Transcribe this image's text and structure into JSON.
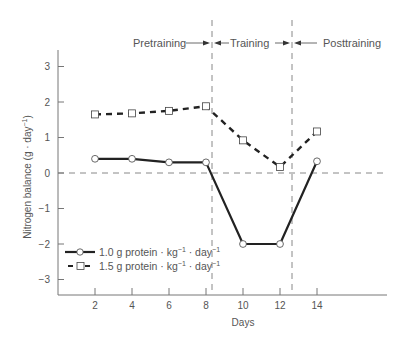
{
  "chart_data": {
    "type": "line",
    "title": "",
    "xlabel": "Days",
    "ylabel": "Nitrogen balance (g · day⁻¹)",
    "x": [
      2,
      4,
      6,
      8,
      10,
      12,
      14
    ],
    "x_ticks": [
      "2",
      "4",
      "6",
      "8",
      "10",
      "12",
      "14"
    ],
    "y_ticks": [
      "3",
      "2",
      "1",
      "0",
      "−1",
      "−2",
      "−3"
    ],
    "y_tick_values": [
      3,
      2,
      1,
      0,
      -1,
      -2,
      -3
    ],
    "xlim": [
      0,
      17.5
    ],
    "ylim": [
      -3.5,
      3.6
    ],
    "grid": false,
    "reference_lines": {
      "horizontal_zero": 0,
      "phase_boundaries_days": [
        8.3,
        12.6
      ]
    },
    "phases": [
      {
        "label": "Pretraining",
        "arrow": "right"
      },
      {
        "label": "Training",
        "arrow": "both"
      },
      {
        "label": "Posttraining",
        "arrow": "left"
      }
    ],
    "series": [
      {
        "name": "1.0 g protein · kg⁻¹ · day⁻¹",
        "marker": "circle",
        "line": "solid",
        "values": [
          0.4,
          0.4,
          0.3,
          0.3,
          -2.0,
          -2.0,
          0.33
        ]
      },
      {
        "name": "1.5 g protein · kg⁻¹ · day⁻¹",
        "marker": "square",
        "line": "dashed",
        "values": [
          1.65,
          1.68,
          1.75,
          1.88,
          0.92,
          0.17,
          1.17
        ]
      }
    ],
    "legend_position": "lower-left inside plot"
  },
  "labels": {
    "xlabel": "Days",
    "ylabel_main": "Nitrogen balance (g · day",
    "ylabel_sup": "−1",
    "ylabel_close": ")",
    "phase_pre": "Pretraining",
    "phase_train": "Training",
    "phase_post": "Posttraining",
    "legend": [
      {
        "main": "1.0 g protein · kg",
        "sup1": "−1",
        "mid": " · day",
        "sup2": "−1"
      },
      {
        "main": "1.5 g protein · kg",
        "sup1": "−1",
        "mid": " · day",
        "sup2": "−1"
      }
    ]
  },
  "colors": {
    "axis": "#777777",
    "series_line": "#222222",
    "reference": "#888888",
    "text": "#555555",
    "marker_fill": "#ffffff"
  }
}
